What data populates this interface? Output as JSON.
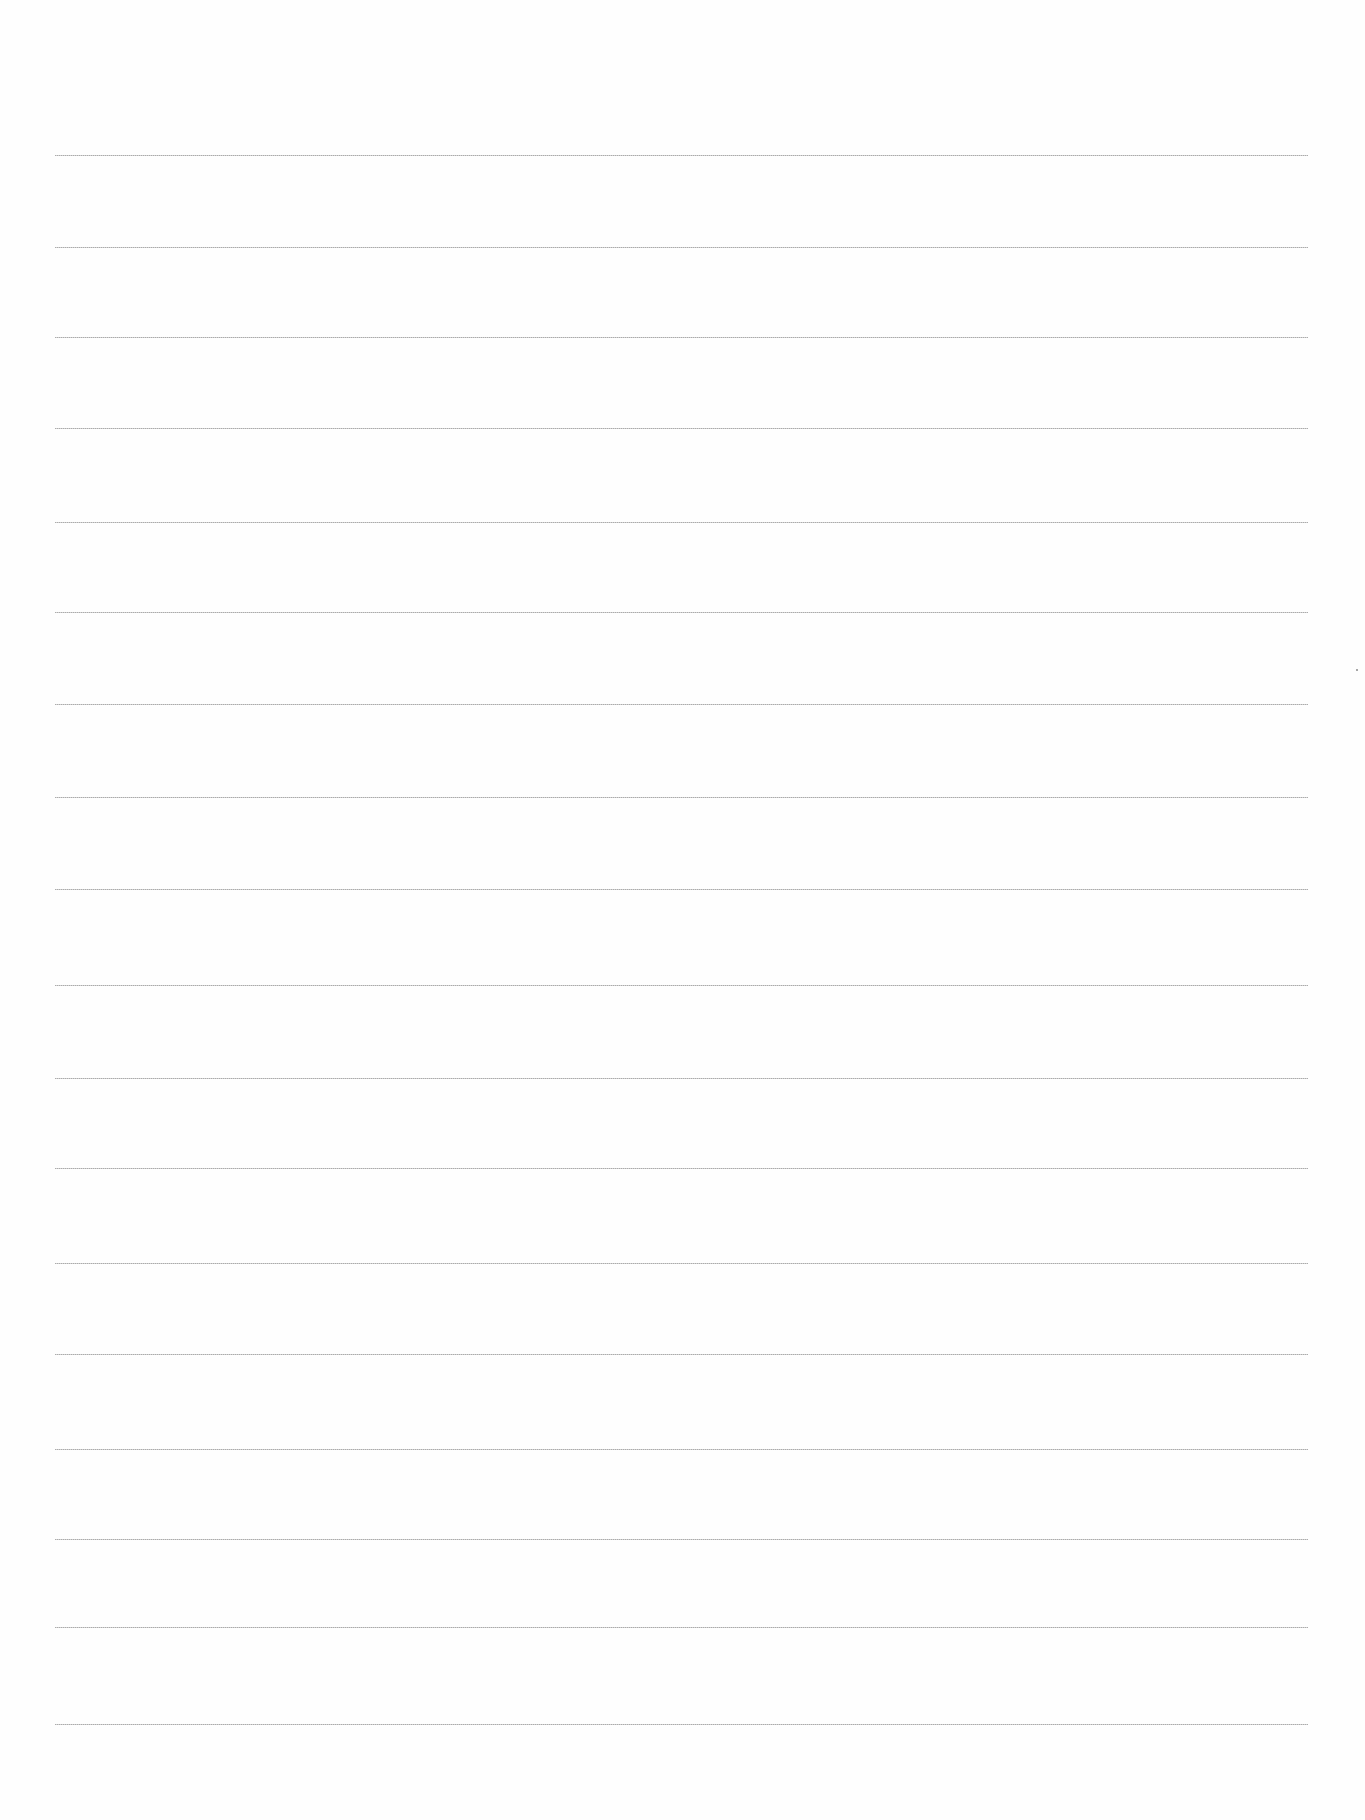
{
  "page": {
    "type": "lined-paper",
    "background": "#fefefe",
    "line_color": "#9a9a9a",
    "line_left": 55,
    "line_width": 1253,
    "line_count": 18,
    "line_positions_y": [
      155,
      247,
      337,
      428,
      522,
      612,
      704,
      797,
      889,
      985,
      1078,
      1168,
      1263,
      1354,
      1449,
      1539,
      1627,
      1724
    ]
  }
}
